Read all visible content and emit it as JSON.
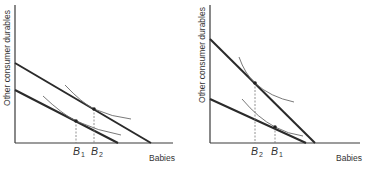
{
  "panels": [
    {
      "id": "left",
      "y_axis_label": "Other consumer durables",
      "x_axis_label": "Babies",
      "marks": [
        {
          "base": "B",
          "sub": "1"
        },
        {
          "base": "B",
          "sub": "2"
        }
      ],
      "description": "Income increase shifts budget line parallel outward; quantity of babies rises from B1 to B2"
    },
    {
      "id": "right",
      "y_axis_label": "Other consumer durables",
      "x_axis_label": "Babies",
      "marks": [
        {
          "base": "B",
          "sub": "2"
        },
        {
          "base": "B",
          "sub": "1"
        }
      ],
      "description": "Budget line pivots (higher relative cost of babies); quantity of babies falls from B1 to B2"
    }
  ]
}
